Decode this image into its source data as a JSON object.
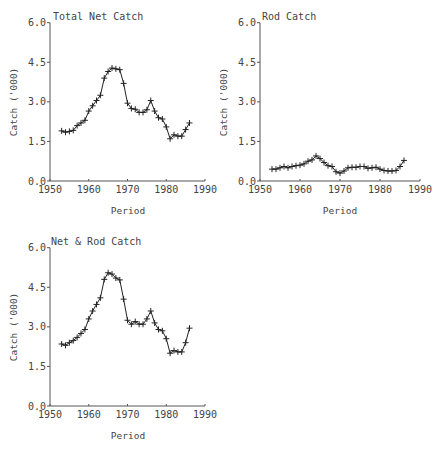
{
  "chart_data": [
    {
      "type": "line",
      "title": "Total Net Catch",
      "xlabel": "Period",
      "ylabel": "Catch ('000)",
      "xlim": [
        1950,
        1990
      ],
      "ylim": [
        0.0,
        6.0
      ],
      "xticks": [
        "1950",
        "1960",
        "1970",
        "1980",
        "1990"
      ],
      "yticks": [
        "0.0",
        "1.5",
        "3.0",
        "4.5",
        "6.0"
      ],
      "marker": "+",
      "grid": false,
      "x": [
        1953,
        1954,
        1955,
        1956,
        1957,
        1958,
        1959,
        1960,
        1961,
        1962,
        1963,
        1964,
        1965,
        1966,
        1967,
        1968,
        1969,
        1970,
        1971,
        1972,
        1973,
        1974,
        1975,
        1976,
        1977,
        1978,
        1979,
        1980,
        1981,
        1982,
        1983,
        1984,
        1985,
        1986
      ],
      "values": [
        1.9,
        1.85,
        1.88,
        1.92,
        2.1,
        2.2,
        2.3,
        2.65,
        2.85,
        3.05,
        3.25,
        3.9,
        4.15,
        4.28,
        4.25,
        4.22,
        3.7,
        2.95,
        2.75,
        2.72,
        2.6,
        2.6,
        2.7,
        3.05,
        2.65,
        2.4,
        2.35,
        2.05,
        1.6,
        1.75,
        1.7,
        1.7,
        1.95,
        2.2
      ]
    },
    {
      "type": "line",
      "title": "Rod Catch",
      "xlabel": "Period",
      "ylabel": "Catch ('000)",
      "xlim": [
        1950,
        1990
      ],
      "ylim": [
        0.0,
        6.0
      ],
      "xticks": [
        "1950",
        "1960",
        "1970",
        "1980",
        "1990"
      ],
      "yticks": [
        "0.0",
        "1.5",
        "3.0",
        "4.5",
        "6.0"
      ],
      "marker": "+",
      "grid": false,
      "x": [
        1953,
        1954,
        1955,
        1956,
        1957,
        1958,
        1959,
        1960,
        1961,
        1962,
        1963,
        1964,
        1965,
        1966,
        1967,
        1968,
        1969,
        1970,
        1971,
        1972,
        1973,
        1974,
        1975,
        1976,
        1977,
        1978,
        1979,
        1980,
        1981,
        1982,
        1983,
        1984,
        1985,
        1986
      ],
      "values": [
        0.45,
        0.45,
        0.5,
        0.55,
        0.5,
        0.55,
        0.58,
        0.6,
        0.65,
        0.75,
        0.8,
        0.95,
        0.85,
        0.7,
        0.58,
        0.55,
        0.35,
        0.3,
        0.38,
        0.5,
        0.52,
        0.52,
        0.55,
        0.55,
        0.48,
        0.5,
        0.52,
        0.45,
        0.4,
        0.38,
        0.38,
        0.4,
        0.55,
        0.78
      ]
    },
    {
      "type": "line",
      "title": "Net & Rod Catch",
      "xlabel": "Period",
      "ylabel": "Catch ('000)",
      "xlim": [
        1950,
        1990
      ],
      "ylim": [
        0.0,
        6.0
      ],
      "xticks": [
        "1950",
        "1960",
        "1970",
        "1980",
        "1990"
      ],
      "yticks": [
        "0.0",
        "1.5",
        "3.0",
        "4.5",
        "6.0"
      ],
      "marker": "+",
      "grid": false,
      "x": [
        1953,
        1954,
        1955,
        1956,
        1957,
        1958,
        1959,
        1960,
        1961,
        1962,
        1963,
        1964,
        1965,
        1966,
        1967,
        1968,
        1969,
        1970,
        1971,
        1972,
        1973,
        1974,
        1975,
        1976,
        1977,
        1978,
        1979,
        1980,
        1981,
        1982,
        1983,
        1984,
        1985,
        1986
      ],
      "values": [
        2.35,
        2.3,
        2.4,
        2.48,
        2.6,
        2.75,
        2.9,
        3.3,
        3.6,
        3.85,
        4.1,
        4.8,
        5.05,
        5.0,
        4.85,
        4.78,
        4.05,
        3.25,
        3.1,
        3.2,
        3.1,
        3.1,
        3.3,
        3.6,
        3.15,
        2.9,
        2.85,
        2.55,
        2.0,
        2.1,
        2.05,
        2.05,
        2.4,
        2.95
      ]
    }
  ],
  "colors": {
    "line": "#222222",
    "axis": "#555555",
    "text": "#444444"
  }
}
